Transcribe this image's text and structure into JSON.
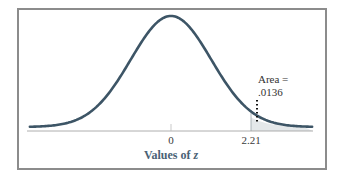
{
  "chart_data": {
    "type": "area",
    "title": "",
    "subtitle": "",
    "xlabel": "Values of z",
    "ylabel": "",
    "distribution": "standard normal",
    "x_ticks": [
      0,
      2.21
    ],
    "x_tick_labels": [
      "0",
      "2.21"
    ],
    "xlim": [
      -3.5,
      3.5
    ],
    "shaded_region": {
      "from": 2.21,
      "to": 3.5,
      "area": 0.0136
    },
    "annotations": [
      {
        "text": "Area =\n.0136",
        "points_to": 2.21
      }
    ],
    "grid": false,
    "legend": null
  },
  "labels": {
    "tick_0": "0",
    "tick_221": "2.21",
    "xlabel_prefix": "Values of ",
    "xlabel_var": "z",
    "annotation_line1": "Area =",
    "annotation_line2": ".0136"
  },
  "colors": {
    "curve": "#3d5566",
    "shade": "#e4e8ea",
    "frame": "#8c8c8c",
    "axis_label": "#4a6275"
  }
}
